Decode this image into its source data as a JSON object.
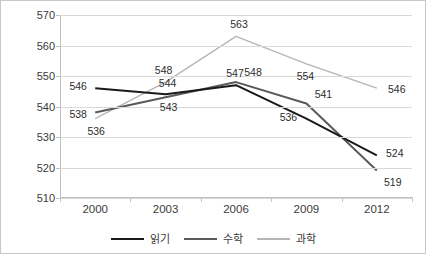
{
  "chart_data": {
    "type": "line",
    "title": "",
    "subtitle": "",
    "xlabel": "",
    "ylabel": "",
    "categories": [
      "2000",
      "2003",
      "2006",
      "2009",
      "2012"
    ],
    "ylim": [
      510,
      570
    ],
    "yticks": [
      510,
      520,
      530,
      540,
      550,
      560,
      570
    ],
    "grid": "horizontal",
    "legend_position": "bottom",
    "show_data_labels": true,
    "series": [
      {
        "name": "읽기",
        "color": "#1a1a1a",
        "values": [
          546,
          544,
          547,
          536,
          524
        ],
        "labels": [
          "546",
          "544",
          "547",
          "536",
          "524"
        ]
      },
      {
        "name": "수학",
        "color": "#5a5a5a",
        "values": [
          538,
          543,
          548,
          541,
          519
        ],
        "labels": [
          "538",
          "543",
          "548",
          "541",
          "519"
        ]
      },
      {
        "name": "과학",
        "color": "#b5b5b5",
        "values": [
          536,
          548,
          563,
          554,
          546
        ],
        "labels": [
          "536",
          "548",
          "563",
          "554",
          "546"
        ]
      }
    ]
  },
  "axes": {
    "y_tick_labels": [
      "570",
      "560",
      "550",
      "540",
      "530",
      "520",
      "510"
    ],
    "x_tick_labels": [
      "2000",
      "2003",
      "2006",
      "2009",
      "2012"
    ]
  },
  "legend": {
    "items": [
      {
        "label": "읽기",
        "color": "#1a1a1a"
      },
      {
        "label": "수학",
        "color": "#5a5a5a"
      },
      {
        "label": "과학",
        "color": "#b5b5b5"
      }
    ]
  },
  "colors": {
    "grid": "#d9d9d9",
    "axis": "#bfbfbf",
    "border": "#c8c8c8",
    "text": "#3b3b3b",
    "background": "#ffffff"
  }
}
